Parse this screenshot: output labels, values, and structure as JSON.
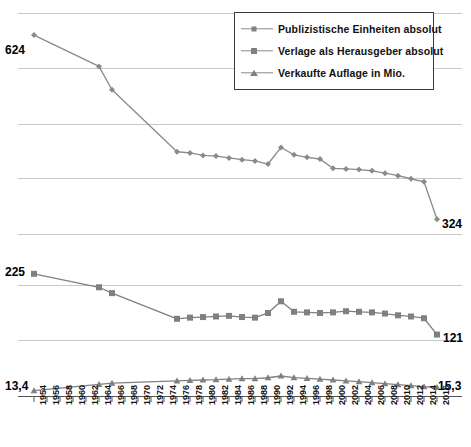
{
  "chart_data": {
    "type": "line",
    "title": "",
    "xlabel": "",
    "ylabel": "",
    "grid": true,
    "legend_position": "top-right",
    "x": [
      1954,
      1956,
      1958,
      1960,
      1962,
      1964,
      1966,
      1968,
      1970,
      1972,
      1974,
      1976,
      1978,
      1980,
      1982,
      1984,
      1986,
      1988,
      1990,
      1992,
      1994,
      1996,
      1998,
      2000,
      2002,
      2004,
      2006,
      2008,
      2010,
      2012,
      2014,
      2016
    ],
    "panels": [
      {
        "name": "Publizistische Einheiten absolut",
        "axis_labels": {
          "start": "624",
          "end": "324"
        },
        "ylim": [
          300,
          660
        ]
      },
      {
        "name": "Verlage als Herausgeber absolut",
        "axis_labels": {
          "start": "225",
          "end": "121"
        },
        "ylim": [
          110,
          235
        ]
      },
      {
        "name": "Verkaufte Auflage in Mio.",
        "axis_labels": {
          "start": "13,4",
          "end": "15,3"
        },
        "ylim": [
          10,
          25
        ]
      }
    ],
    "series": [
      {
        "name": "Publizistische Einheiten  absolut",
        "marker": "diamond",
        "panel": 0,
        "color": "#8a8a8a",
        "values": [
          624,
          null,
          null,
          null,
          null,
          573,
          535,
          null,
          null,
          null,
          null,
          434,
          432,
          428,
          427,
          424,
          421,
          419,
          414,
          441,
          429,
          425,
          422,
          407,
          406,
          405,
          403,
          399,
          395,
          390,
          385,
          324
        ]
      },
      {
        "name": "Verlage als Herausgeber absolut",
        "marker": "square",
        "panel": 1,
        "color": "#808080",
        "values": [
          225,
          null,
          null,
          null,
          null,
          202,
          192,
          null,
          null,
          null,
          null,
          148,
          150,
          151,
          152,
          153,
          151,
          150,
          158,
          178,
          160,
          159,
          158,
          159,
          161,
          160,
          159,
          157,
          154,
          152,
          149,
          121
        ]
      },
      {
        "name": "Verkaufte Auflage in Mio.",
        "marker": "triangle",
        "panel": 2,
        "color": "#808080",
        "values": [
          13.4,
          null,
          null,
          null,
          null,
          17.3,
          18.0,
          null,
          null,
          null,
          null,
          19.5,
          19.8,
          20.0,
          20.2,
          20.6,
          20.8,
          20.9,
          21.4,
          22.5,
          21.5,
          21.0,
          20.5,
          20.0,
          19.5,
          19.0,
          18.3,
          17.7,
          17.1,
          16.5,
          15.9,
          15.3
        ]
      }
    ]
  },
  "legend": {
    "items": [
      {
        "label": "Publizistische Einheiten  absolut",
        "marker": "diamond"
      },
      {
        "label": "Verlage als Herausgeber absolut",
        "marker": "square"
      },
      {
        "label": "Verkaufte Auflage in Mio.",
        "marker": "triangle"
      }
    ]
  },
  "value_labels": {
    "top_start": "624",
    "top_end": "324",
    "mid_start": "225",
    "mid_end": "121",
    "bot_start": "13,4",
    "bot_end": "15,3"
  },
  "colors": {
    "line": "#8a8a8a",
    "marker": "#808080",
    "grid": "#c9c9c9",
    "axis": "#555555",
    "text": "#000000",
    "legend_border": "#3a3a3a",
    "background": "#ffffff"
  }
}
